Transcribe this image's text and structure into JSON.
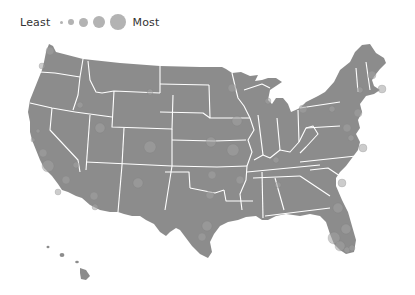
{
  "legend": {
    "least_label": "Least",
    "most_label": "Most",
    "sizes": [
      3,
      5,
      7,
      9,
      12
    ]
  },
  "colors": {
    "land": "#8c8c8c",
    "border": "#ffffff",
    "bubble": "#a3a3a3",
    "legend_dot": "#b3b3b3",
    "text": "#333333"
  },
  "bubbles": [
    {
      "x": 50,
      "y": 51,
      "r": 4
    },
    {
      "x": 42,
      "y": 66,
      "r": 3
    },
    {
      "x": 80,
      "y": 105,
      "r": 3
    },
    {
      "x": 100,
      "y": 128,
      "r": 5
    },
    {
      "x": 38,
      "y": 131,
      "r": 2
    },
    {
      "x": 33,
      "y": 140,
      "r": 2
    },
    {
      "x": 150,
      "y": 147,
      "r": 6
    },
    {
      "x": 43,
      "y": 153,
      "r": 4
    },
    {
      "x": 48,
      "y": 166,
      "r": 6
    },
    {
      "x": 76,
      "y": 165,
      "r": 3
    },
    {
      "x": 66,
      "y": 180,
      "r": 4
    },
    {
      "x": 58,
      "y": 192,
      "r": 3
    },
    {
      "x": 138,
      "y": 183,
      "r": 5
    },
    {
      "x": 94,
      "y": 196,
      "r": 4
    },
    {
      "x": 95,
      "y": 207,
      "r": 3
    },
    {
      "x": 232,
      "y": 88,
      "r": 4
    },
    {
      "x": 268,
      "y": 101,
      "r": 3
    },
    {
      "x": 237,
      "y": 121,
      "r": 5
    },
    {
      "x": 211,
      "y": 142,
      "r": 5
    },
    {
      "x": 233,
      "y": 150,
      "r": 6
    },
    {
      "x": 212,
      "y": 175,
      "r": 4
    },
    {
      "x": 240,
      "y": 180,
      "r": 4
    },
    {
      "x": 210,
      "y": 195,
      "r": 4
    },
    {
      "x": 207,
      "y": 226,
      "r": 5
    },
    {
      "x": 202,
      "y": 237,
      "r": 4
    },
    {
      "x": 303,
      "y": 109,
      "r": 4
    },
    {
      "x": 276,
      "y": 160,
      "r": 3
    },
    {
      "x": 332,
      "y": 109,
      "r": 3
    },
    {
      "x": 358,
      "y": 113,
      "r": 4
    },
    {
      "x": 347,
      "y": 128,
      "r": 4
    },
    {
      "x": 363,
      "y": 148,
      "r": 4
    },
    {
      "x": 372,
      "y": 75,
      "r": 4
    },
    {
      "x": 382,
      "y": 89,
      "r": 4
    },
    {
      "x": 360,
      "y": 90,
      "r": 3
    },
    {
      "x": 351,
      "y": 138,
      "r": 3
    },
    {
      "x": 342,
      "y": 183,
      "r": 4
    },
    {
      "x": 338,
      "y": 208,
      "r": 5
    },
    {
      "x": 346,
      "y": 229,
      "r": 5
    },
    {
      "x": 334,
      "y": 238,
      "r": 6
    },
    {
      "x": 340,
      "y": 246,
      "r": 5
    },
    {
      "x": 347,
      "y": 250,
      "r": 3
    },
    {
      "x": 352,
      "y": 248,
      "r": 3
    },
    {
      "x": 150,
      "y": 92,
      "r": 3
    },
    {
      "x": 278,
      "y": 185,
      "r": 3
    }
  ]
}
